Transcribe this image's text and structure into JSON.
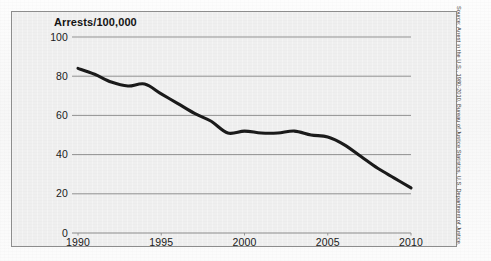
{
  "figure": {
    "title": "Arrests/100,000",
    "source_note": "Source: Arrest in the U.S., 1980-2010, Bureau of Justice Statistics, U.S. Department of Justice."
  },
  "colors": {
    "line": "#1a1a1a",
    "gridline": "#8c8c8c",
    "frame": "#8d8d8d",
    "panel_background": "#efefef",
    "text": "#141414"
  },
  "chart_data": {
    "type": "line",
    "title": "Arrests/100,000",
    "xlabel": "",
    "ylabel": "Arrests/100,000",
    "xlim": [
      1990,
      2010
    ],
    "ylim": [
      0,
      100
    ],
    "grid": true,
    "legend": false,
    "ytick_labels": [
      "100",
      "80",
      "60",
      "40",
      "20",
      "0"
    ],
    "yticks": [
      100,
      80,
      60,
      40,
      20,
      0
    ],
    "xtick_labels": [
      "1990",
      "1995",
      "2000",
      "2005",
      "2010"
    ],
    "xticks": [
      1990,
      1995,
      2000,
      2005,
      2010
    ],
    "x": [
      1990,
      1991,
      1992,
      1993,
      1994,
      1995,
      1996,
      1997,
      1998,
      1999,
      2000,
      2001,
      2002,
      2003,
      2004,
      2005,
      2006,
      2007,
      2008,
      2009,
      2010
    ],
    "series": [
      {
        "name": "Arrests per 100,000",
        "values": [
          84,
          81,
          77,
          75,
          76,
          71,
          66,
          61,
          57,
          51,
          52,
          51,
          51,
          52,
          50,
          49,
          45,
          39,
          33,
          28,
          23
        ]
      }
    ]
  }
}
